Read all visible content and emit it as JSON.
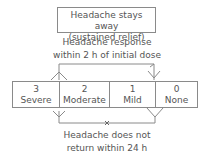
{
  "top_box": {
    "line1": "Headache stays away",
    "line2": "(sustained relief)"
  },
  "response_label": {
    "line1": "Headache response",
    "line2": "within 2 h of initial dose"
  },
  "scale": [
    {
      "value": "3",
      "label": "Severe"
    },
    {
      "value": "2",
      "label": "Moderate"
    },
    {
      "value": "1",
      "label": "Mild"
    },
    {
      "value": "0",
      "label": "None"
    }
  ],
  "bottom_label": {
    "line1": "Headache does not",
    "line2": "return within 24 h"
  },
  "colors": {
    "line": "#8a8a8a",
    "text": "#555555"
  }
}
